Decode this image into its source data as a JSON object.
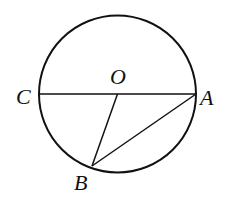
{
  "diagram": {
    "type": "geometry",
    "circle": {
      "center": "O",
      "cx": 117.5,
      "cy": 94,
      "r": 78.5
    },
    "points": {
      "O": {
        "label": "O",
        "x": 117.5,
        "y": 94,
        "lx": 118,
        "ly": 84
      },
      "A": {
        "label": "A",
        "x": 196,
        "y": 94,
        "lx": 208,
        "ly": 105
      },
      "C": {
        "label": "C",
        "x": 39,
        "y": 94,
        "lx": 24,
        "ly": 103
      },
      "B": {
        "label": "B",
        "x": 92,
        "y": 166,
        "lx": 82,
        "ly": 190
      }
    },
    "segments": [
      {
        "from": "C",
        "to": "A",
        "name": "diameter-CA"
      },
      {
        "from": "O",
        "to": "B",
        "name": "radius-OB"
      },
      {
        "from": "B",
        "to": "A",
        "name": "chord-BA"
      }
    ],
    "stroke_color": "#111111"
  }
}
